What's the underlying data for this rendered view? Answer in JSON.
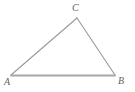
{
  "figure": {
    "type": "geometry-diagram",
    "shape": "triangle",
    "background_color": "#ffffff",
    "stroke_color": "#9a9a9a",
    "base_stroke_color": "#a6a6a6",
    "label_color": "#5f5f5f",
    "width": 135,
    "height": 92,
    "vertices": [
      {
        "name": "A",
        "label": "A",
        "x": 11,
        "y": 75,
        "label_x": 4,
        "label_y": 77
      },
      {
        "name": "B",
        "label": "B",
        "x": 115,
        "y": 75,
        "label_x": 118,
        "label_y": 76
      },
      {
        "name": "C",
        "label": "C",
        "x": 77,
        "y": 18,
        "label_x": 72,
        "label_y": 3
      }
    ],
    "edges": [
      {
        "name": "side-AC",
        "from": "A",
        "to": "C",
        "stroke_width": 1.1
      },
      {
        "name": "side-CB",
        "from": "C",
        "to": "B",
        "stroke_width": 1.1
      },
      {
        "name": "side-AB",
        "from": "A",
        "to": "B",
        "stroke_width": 1.8
      }
    ]
  }
}
